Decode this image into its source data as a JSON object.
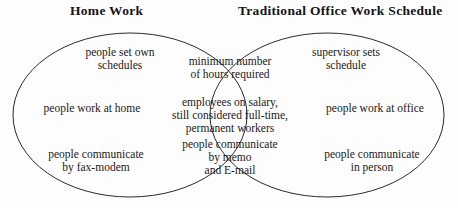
{
  "diagram": {
    "type": "venn",
    "stroke_color": "#2b2b2b",
    "background_color": "#fdfdfd",
    "text_color": "#1a1a1a"
  },
  "headings": {
    "left": "Home Work",
    "right": "Traditional Office Work Schedule"
  },
  "left_only": [
    {
      "lines": [
        "people set own",
        "schedules"
      ]
    },
    {
      "lines": [
        "people work at home"
      ]
    },
    {
      "lines": [
        "people communicate",
        "by fax-modem"
      ]
    }
  ],
  "intersection": [
    {
      "lines": [
        "minimum number",
        "of hours required"
      ]
    },
    {
      "lines": [
        "employees on salary,",
        "still considered full-time,",
        "permanent workers"
      ]
    },
    {
      "lines": [
        "people communicate",
        "by memo",
        "and E-mail"
      ]
    }
  ],
  "right_only": [
    {
      "lines": [
        "supervisor sets",
        "schedule"
      ]
    },
    {
      "lines": [
        "people work at office"
      ]
    },
    {
      "lines": [
        "people communicate",
        "in person"
      ]
    }
  ]
}
